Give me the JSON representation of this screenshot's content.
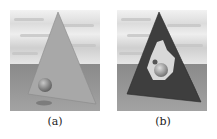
{
  "figure": {
    "panels": [
      {
        "id": "a",
        "caption": "(a)",
        "description": "Opaque gray pyramid in front of a sphere on a ground plane under a cloudy sky",
        "colors": {
          "pyramid": "#a8a8a8",
          "pyramid_edge": "#7e7e7e",
          "sphere": "#8c8c8c",
          "ground": "#8f8f8f",
          "sky": "#e4e4e4"
        }
      },
      {
        "id": "b",
        "caption": "(b)",
        "description": "Dark pyramid with a cut-out revealing the sphere behind it",
        "colors": {
          "pyramid": "#3e3e3e",
          "pyramid_edge": "#2a2a2a",
          "sphere": "#9a9a9a",
          "hole": "#d8d8d8",
          "ground": "#8f8f8f",
          "sky": "#e4e4e4"
        }
      }
    ]
  }
}
